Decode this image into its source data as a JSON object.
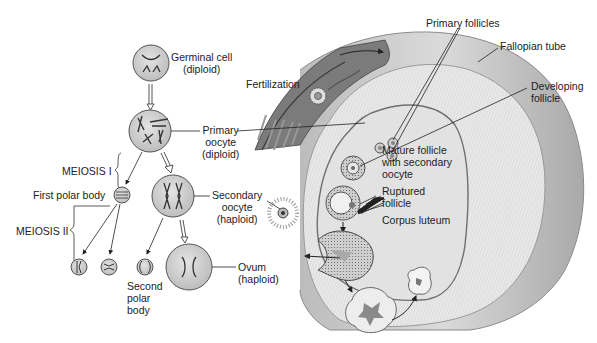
{
  "diagram": {
    "colors": {
      "cell_fill": "#d4d4d4",
      "cell_stroke": "#555555",
      "chromosome": "#333333",
      "tube_fill": "#c9c9c9",
      "tube_dark": "#6a6a6a",
      "ovary_fill": "#dedede",
      "line": "#222222",
      "text": "#222222"
    },
    "meiosis_labels": {
      "meiosis_1": "MEIOSIS I",
      "meiosis_2": "MEIOSIS II"
    },
    "cells": {
      "germinal_cell": {
        "line1": "Germinal cell",
        "line2": "(diploid)"
      },
      "primary_oocyte": {
        "line1": "Primary",
        "line2": "oocyte",
        "line3": "(diploid)"
      },
      "first_polar_body": {
        "line1": "First polar body"
      },
      "secondary_oocyte": {
        "line1": "Secondary",
        "line2": "oocyte",
        "line3": "(haploid)"
      },
      "ovum": {
        "line1": "Ovum",
        "line2": "(haploid)"
      },
      "second_polar_body": {
        "line1": "Second",
        "line2": "polar",
        "line3": "body"
      }
    },
    "ovary_labels": {
      "fertilization": "Fertilization",
      "primary_follicles": "Primary follicles",
      "fallopian_tube": "Fallopian tube",
      "developing_follicle": {
        "line1": "Developing",
        "line2": "follicle"
      },
      "mature_follicle": {
        "line1": "Mature follicle",
        "line2": "with secondary",
        "line3": "oocyte"
      },
      "ruptured_follicle": {
        "line1": "Ruptured",
        "line2": "follicle"
      },
      "corpus_luteum": "Corpus luteum"
    }
  }
}
